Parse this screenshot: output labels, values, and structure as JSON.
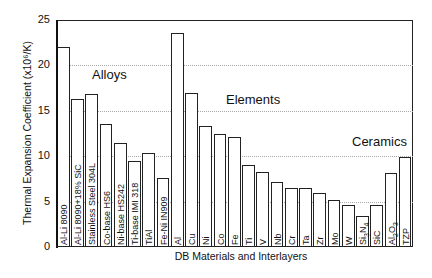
{
  "chart_data": {
    "type": "bar",
    "title": "",
    "xlabel": "DB Materials and Interlayers",
    "ylabel": "Thermal Expansion Coefficient (x10⁶/K)",
    "ylim": [
      0,
      25
    ],
    "yticks": [
      0,
      5,
      10,
      15,
      20,
      25
    ],
    "grid": true,
    "legend": null,
    "annotations": [
      {
        "text": "Alloys",
        "group": "alloys"
      },
      {
        "text": "Elements",
        "group": "elements"
      },
      {
        "text": "Ceramics",
        "group": "ceramics"
      }
    ],
    "categories": [
      "Al-Li 8090",
      "Al-Li 8090+18% SiC",
      "Stainless Steel 304L",
      "Co-base HS6",
      "Ni-base HS242",
      "Ti-base IMI 318",
      "TiAl",
      "Fe-Ni IN909",
      "Al",
      "Cu",
      "Ni",
      "Co",
      "Fe",
      "Ti",
      "V",
      "Nb",
      "Cr",
      "Ta",
      "Zr",
      "Mo",
      "W",
      "Si3N4",
      "SiC",
      "Al2O3",
      "TZP"
    ],
    "values": [
      22.0,
      16.3,
      16.8,
      13.6,
      11.5,
      9.5,
      10.3,
      7.6,
      23.6,
      17.0,
      13.3,
      12.5,
      12.1,
      9.0,
      8.3,
      7.2,
      6.5,
      6.5,
      6.0,
      5.2,
      4.6,
      3.4,
      4.6,
      8.1,
      9.9
    ]
  },
  "labels": {
    "ylabel": "Thermal Expansion Coefficient (x10⁶/K)",
    "xlabel": "DB Materials and Interlayers",
    "alloys": "Alloys",
    "elements": "Elements",
    "ceramics": "Ceramics",
    "yticks": [
      "0",
      "5",
      "10",
      "15",
      "20",
      "25"
    ]
  }
}
